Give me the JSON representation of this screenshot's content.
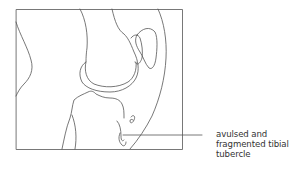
{
  "figure": {
    "annotation": {
      "lines": [
        "avulsed and",
        "fragmented tibial",
        "tubercle"
      ]
    },
    "colors": {
      "stroke": "#555555",
      "background": "#ffffff",
      "text": "#333333"
    }
  }
}
